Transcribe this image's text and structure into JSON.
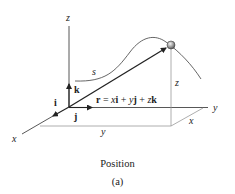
{
  "figure": {
    "axes": {
      "x": "x",
      "y": "y",
      "z": "z"
    },
    "unit_vectors": {
      "i": "i",
      "j": "j",
      "k": "k"
    },
    "path_label": "s",
    "components": {
      "x": "x",
      "y": "y",
      "z": "z"
    },
    "equation": {
      "lhs": "r",
      "eq": " = ",
      "x": "x",
      "i": "i",
      "plus1": " + ",
      "y": "y",
      "j": "j",
      "plus2": " + ",
      "z": "z",
      "k": "k"
    },
    "colors": {
      "line": "#2a2a2a",
      "curve": "#555555",
      "guide": "#888888",
      "particle": "#9a9a9a"
    }
  },
  "caption": {
    "title": "Position",
    "label": "(a)"
  }
}
